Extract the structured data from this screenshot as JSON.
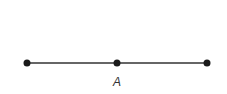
{
  "diagram": {
    "type": "line-segment",
    "stroke_color": "#333333",
    "point_color": "#1a1a1a",
    "segment": {
      "x1": 27,
      "y1": 63,
      "x2": 207,
      "y2": 63
    },
    "points": [
      {
        "name": "left-endpoint",
        "x": 27,
        "y": 63,
        "label": ""
      },
      {
        "name": "midpoint",
        "x": 117,
        "y": 63,
        "label": "A"
      },
      {
        "name": "right-endpoint",
        "x": 207,
        "y": 63,
        "label": ""
      }
    ],
    "labels": {
      "midpoint": "A"
    }
  }
}
